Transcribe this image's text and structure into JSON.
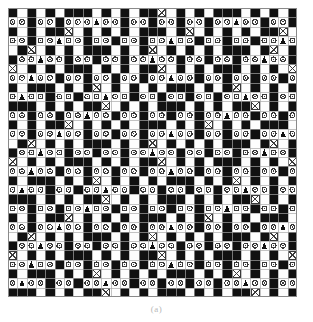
{
  "figure": {
    "caption": "(a)",
    "kind": "needlework-pattern-grid"
  },
  "chart_data": {
    "type": "heatmap",
    "subtitle": "(a)",
    "xlabel": "",
    "ylabel": "",
    "grid": true,
    "legend_position": "none",
    "rows": 31,
    "cols": 31,
    "cell_size_px": 9.3,
    "colors": {
      "filled": "#111111",
      "empty": "#fdfdfd",
      "grid_line": "#a8a8a8",
      "grid_line_major": "#8a8a8a",
      "symbol": "#3a3a3a",
      "background": "#ffffff",
      "caption": "#b9b9b9"
    },
    "symbol_legend": [
      {
        "key": "K",
        "name": "filled-square",
        "glyph": "solid black cell"
      },
      {
        "key": ".",
        "name": "empty-square",
        "glyph": "blank white cell"
      },
      {
        "key": "o",
        "name": "circle-symbol",
        "glyph": "small ring with center dot"
      },
      {
        "key": "x",
        "name": "cross-symbol",
        "glyph": "X inside box"
      },
      {
        "key": "t",
        "name": "triangle-symbol",
        "glyph": "filled triangle / tree"
      }
    ],
    "cell_keys": [
      "K.K.K.KKK.K.K.KKx.K.K.KKK.K.K.K",
      "ooKooKoootooKooKooKooKootooKooK",
      "K.K.KKx.K.K.K.KKK.Kx.K.K.K.KKx.",
      "ooKootooKooKooKootooKooKooKootoo",
      ".Kx.K.K.KKK.K.Kx.K.K.K.KKK.Kx.K",
      "KootooKooKooKootooKooKooKootooKo",
      "x.K.K.KKK.K.K.KKx.K.K.KKK.K.K.x",
      "ootooKooKooKooKootooKooKooKooKoo",
      "K.KKK.K.Kx.K.K.K.KKK.K.Kx.K.K.K",
      "otooKooKootooKooKooKooKootooKooK",
      "KKK.K.K.KKx.K.K.KKK.K.K.KKx.K.K",
      "ooKooKootooKooKooKooKootooKooKoo",
      "K.K.KKx.K.K.K.KKK.K.Kx.K.K.KKK.",
      "ooKootooKooKooKootooKooKooKootoo",
      ".Kx.K.K.KKK.K.Kx.K.K.K.KKK.Kx.K",
      "KootooKooKooKootooKooKooKootooKo",
      "x.K.K.KKK.K.K.KKx.K.K.KKK.K.K.x",
      "ootooKooKooKooKootooKooKooKooKoo",
      "K.KKK.K.Kx.K.K.K.KKK.K.Kx.K.K.K",
      "otooKooKootooKooKooKooKootooKooK",
      "KKK.K.K.KKx.K.K.KKK.K.K.KKx.K.K",
      "ooKooKootooKooKooKooKootooKooKoo",
      "K.K.KKx.K.K.K.KKK.K.Kx.K.K.KKK.",
      "ooKootooKooKooKootooKooKooKootoo",
      ".Kx.K.K.KKK.K.Kx.K.K.K.KKK.Kx.K",
      "KootooKooKooKootooKooKooKootooKo",
      "x.K.K.KKK.K.K.KKx.K.K.KKK.K.K.x",
      "ootooKooKooKooKootooKooKooKooKoo",
      "K.KKK.K.Kx.K.K.K.KKK.K.Kx.K.K.K",
      "otooKooKootooKooKooKooKootooKooK",
      "KKK.K.K.KKx.K.K.KKK.K.K.KKx.K.K"
    ]
  }
}
